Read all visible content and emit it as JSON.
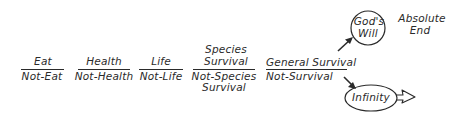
{
  "diagram": {
    "fractions": [
      {
        "numerator": "Eat",
        "denominator": "Not-Eat"
      },
      {
        "numerator": "Health",
        "denominator": "Not-Health"
      },
      {
        "numerator": "Life",
        "denominator": "Not-Life"
      },
      {
        "numerator_line1": "Species",
        "numerator_line2": "Survival",
        "denominator_line1": "Not-Species",
        "denominator_line2": "Survival"
      },
      {
        "numerator": "General Survival",
        "denominator": "Not-Survival"
      }
    ],
    "gods_will": {
      "line1": "God's",
      "line2": "Will"
    },
    "absolute_end": {
      "line1": "Absolute",
      "line2": "End"
    },
    "infinity": {
      "label": "Infinity"
    },
    "colors": {
      "ink": "#2a2a2a",
      "background": "#ffffff"
    }
  }
}
